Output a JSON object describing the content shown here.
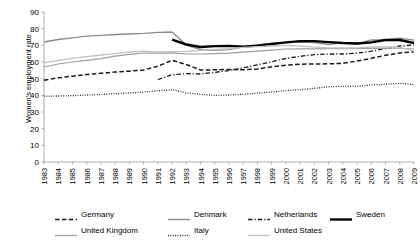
{
  "chart_data": {
    "type": "line",
    "title": "",
    "xlabel": "",
    "ylabel": "Women's employment rate",
    "ylim": [
      0,
      90
    ],
    "ytick_step": 10,
    "yticks": [
      "0",
      "10",
      "20",
      "30",
      "40",
      "50",
      "60",
      "70",
      "80",
      "90"
    ],
    "grid": false,
    "legend_position": "bottom",
    "x": [
      1983,
      1984,
      1985,
      1986,
      1987,
      1988,
      1989,
      1990,
      1991,
      1992,
      1993,
      1994,
      1995,
      1996,
      1997,
      1998,
      1999,
      2000,
      2001,
      2002,
      2003,
      2004,
      2005,
      2006,
      2007,
      2008,
      2009
    ],
    "xtick_labels": [
      "1983",
      "1984",
      "1985",
      "1986",
      "1987",
      "1988",
      "1989",
      "1990",
      "1991",
      "1992",
      "1993",
      "1994",
      "1995",
      "1996",
      "1997",
      "1998",
      "1999",
      "2000",
      "2001",
      "2002",
      "2003",
      "2004",
      "2005",
      "2006",
      "2007",
      "2008",
      "2009"
    ],
    "series": [
      {
        "name": "Germany",
        "style": "dashed",
        "color": "#1a1a1a",
        "width": 1.5,
        "values": [
          49.0,
          50.5,
          51.5,
          52.5,
          53.2,
          54.0,
          54.5,
          55.2,
          57.5,
          61.0,
          58.5,
          55.2,
          55.3,
          55.5,
          55.3,
          55.8,
          57.1,
          58.1,
          58.7,
          58.8,
          58.9,
          59.2,
          60.6,
          62.2,
          64.0,
          65.4,
          66.2
        ]
      },
      {
        "name": "Denmark",
        "style": "solid",
        "color": "#8c8c8c",
        "width": 1.4,
        "values": [
          72.0,
          73.5,
          74.5,
          75.5,
          76.0,
          76.5,
          76.8,
          77.2,
          77.8,
          78.0,
          70.2,
          67.5,
          67.0,
          67.4,
          69.1,
          70.2,
          71.1,
          71.6,
          72.0,
          71.7,
          70.5,
          71.6,
          70.8,
          73.2,
          73.2,
          74.3,
          73.1
        ]
      },
      {
        "name": "Netherlands",
        "style": "dashdot",
        "color": "#1a1a1a",
        "width": 1.3,
        "values": [
          null,
          null,
          null,
          null,
          null,
          null,
          null,
          null,
          49.5,
          52.4,
          53.0,
          52.8,
          53.8,
          54.8,
          56.5,
          58.3,
          60.1,
          62.1,
          63.4,
          64.4,
          64.8,
          64.8,
          65.3,
          66.5,
          68.0,
          69.6,
          70.2
        ]
      },
      {
        "name": "Sweden",
        "style": "solid",
        "color": "#000000",
        "width": 2.4,
        "values": [
          null,
          null,
          null,
          null,
          null,
          null,
          null,
          null,
          null,
          73.4,
          70.5,
          69.0,
          69.5,
          69.7,
          69.2,
          69.8,
          70.8,
          71.8,
          72.5,
          72.5,
          71.9,
          71.4,
          71.1,
          71.8,
          73.2,
          73.2,
          71.4
        ]
      },
      {
        "name": "United Kingdom",
        "style": "solid",
        "color": "#9e9e9e",
        "width": 1.2,
        "values": [
          57.0,
          58.8,
          60.0,
          61.0,
          62.0,
          63.5,
          64.6,
          65.4,
          65.3,
          65.5,
          64.8,
          64.8,
          65.0,
          65.3,
          65.9,
          66.5,
          67.1,
          67.8,
          67.9,
          67.9,
          68.0,
          68.0,
          68.0,
          68.2,
          68.2,
          68.4,
          67.8
        ]
      },
      {
        "name": "Italy",
        "style": "dotted",
        "color": "#1a1a1a",
        "width": 1.3,
        "values": [
          39.5,
          39.6,
          39.8,
          40.2,
          40.5,
          41.0,
          41.4,
          42.0,
          42.8,
          43.4,
          41.5,
          40.6,
          40.0,
          40.2,
          40.6,
          41.3,
          42.0,
          42.8,
          43.4,
          44.2,
          45.1,
          45.4,
          45.3,
          46.3,
          46.6,
          47.2,
          46.4
        ]
      },
      {
        "name": "United States",
        "style": "solid",
        "color": "#c2c2c2",
        "width": 1.3,
        "values": [
          59.5,
          61.0,
          62.2,
          63.2,
          64.2,
          65.0,
          66.0,
          66.5,
          66.0,
          66.2,
          66.4,
          67.0,
          67.5,
          68.0,
          68.8,
          69.2,
          69.6,
          70.0,
          69.5,
          68.9,
          68.5,
          68.4,
          68.5,
          69.0,
          69.1,
          68.8,
          66.6
        ]
      }
    ]
  },
  "legend": {
    "rows": [
      [
        {
          "label": "Germany",
          "style": "dashed",
          "color": "#1a1a1a",
          "width": 1.6
        },
        {
          "label": "Denmark",
          "style": "solid",
          "color": "#8c8c8c",
          "width": 1.4
        },
        {
          "label": "Netherlands",
          "style": "dashdot",
          "color": "#1a1a1a",
          "width": 1.4
        },
        {
          "label": "Sweden",
          "style": "solid",
          "color": "#000000",
          "width": 2.4
        }
      ],
      [
        {
          "label": "United Kingdom",
          "style": "solid",
          "color": "#9e9e9e",
          "width": 1.3
        },
        {
          "label": "Italy",
          "style": "dotted",
          "color": "#1a1a1a",
          "width": 1.4
        },
        {
          "label": "United States",
          "style": "solid",
          "color": "#c2c2c2",
          "width": 1.4
        }
      ]
    ]
  }
}
